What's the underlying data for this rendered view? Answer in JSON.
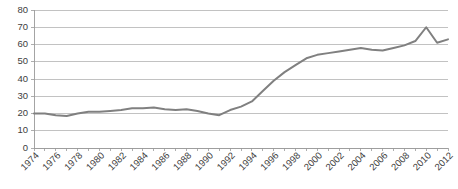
{
  "chart_data": {
    "type": "line",
    "title": "",
    "subtitle": "",
    "xlabel": "",
    "ylabel": "",
    "xlim": [
      1974,
      2012
    ],
    "ylim": [
      0,
      80
    ],
    "ytick_labels": [
      "0",
      "10",
      "20",
      "30",
      "40",
      "50",
      "60",
      "70",
      "80"
    ],
    "ytick_values": [
      0,
      10,
      20,
      30,
      40,
      50,
      60,
      70,
      80
    ],
    "xtick_labels": [
      "1974",
      "1976",
      "1978",
      "1980",
      "1982",
      "1984",
      "1986",
      "1988",
      "1990",
      "1992",
      "1994",
      "1996",
      "1998",
      "2000",
      "2002",
      "2004",
      "2006",
      "2008",
      "2010",
      "2012"
    ],
    "xtick_values": [
      1974,
      1976,
      1978,
      1980,
      1982,
      1984,
      1986,
      1988,
      1990,
      1992,
      1994,
      1996,
      1998,
      2000,
      2002,
      2004,
      2006,
      2008,
      2010,
      2012
    ],
    "grid": true,
    "grid_axis": "y",
    "legend": false,
    "legend_position": "none",
    "line_color": "#808080",
    "grid_color": "#b3b3b3",
    "axis_color": "#9a9a9a",
    "background_color": "#ffffff",
    "x": [
      1974,
      1975,
      1976,
      1977,
      1978,
      1979,
      1980,
      1981,
      1982,
      1983,
      1984,
      1985,
      1986,
      1987,
      1988,
      1989,
      1990,
      1991,
      1992,
      1993,
      1994,
      1995,
      1996,
      1997,
      1998,
      1999,
      2000,
      2001,
      2002,
      2003,
      2004,
      2005,
      2006,
      2007,
      2008,
      2009,
      2010,
      2011,
      2012
    ],
    "values": [
      20,
      20,
      19,
      18.5,
      20,
      21,
      21,
      21.5,
      22,
      23,
      23,
      23.5,
      22.5,
      22,
      22.5,
      21.5,
      20,
      19,
      22,
      24,
      27,
      33,
      39,
      44,
      48,
      52,
      54,
      55,
      56,
      57,
      58,
      57,
      56.5,
      58,
      59.5,
      62,
      70,
      61,
      63
    ]
  }
}
